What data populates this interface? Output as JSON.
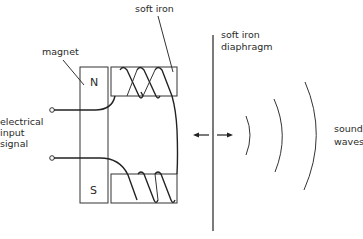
{
  "diagram": {
    "type": "moving-iron earphone / loudspeaker schematic",
    "labels": {
      "soft_iron": "soft iron",
      "magnet": "magnet",
      "input_line1": "electrical",
      "input_line2": "input",
      "input_line3": "signal",
      "diaphragm_line1": "soft iron",
      "diaphragm_line2": "diaphragm",
      "sound_line1": "sound",
      "sound_line2": "waves",
      "pole_north": "N",
      "pole_south": "S"
    },
    "components": [
      {
        "id": "magnet",
        "poles": [
          "N",
          "S"
        ]
      },
      {
        "id": "upper-soft-iron-core",
        "coil_turns": 3
      },
      {
        "id": "lower-soft-iron-core",
        "coil_turns": 3
      },
      {
        "id": "soft-iron-diaphragm"
      },
      {
        "id": "input-terminals",
        "count": 2
      },
      {
        "id": "vibration-arrows",
        "direction": "left-right"
      },
      {
        "id": "sound-wave-arcs",
        "count": 3
      }
    ],
    "colors": {
      "line": "#333333",
      "background": "#ffffff"
    }
  }
}
